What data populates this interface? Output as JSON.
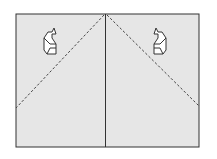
{
  "diagram": {
    "type": "origami-fold-step",
    "colors": {
      "paper": "#e6e6e6",
      "outline": "#333333",
      "fold_line": "#444444",
      "arrow_fill": "#ffffff",
      "background": "#ffffff"
    },
    "paper": {
      "x": 16,
      "y": 14,
      "width": 183,
      "height": 133
    },
    "center_crease": {
      "x": 105
    },
    "valley_folds": [
      {
        "from": [
          105,
          14
        ],
        "to": [
          16,
          108
        ]
      },
      {
        "from": [
          105,
          14
        ],
        "to": [
          199,
          106
        ]
      }
    ],
    "arrows": [
      {
        "name": "fold-arrow-left",
        "x": 50,
        "y": 40,
        "mirror": false
      },
      {
        "name": "fold-arrow-right",
        "x": 160,
        "y": 40,
        "mirror": true
      }
    ]
  }
}
